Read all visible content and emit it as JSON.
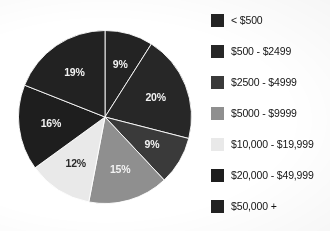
{
  "title_fragment": "",
  "chart_data": {
    "type": "pie",
    "title": "",
    "subtitle": "",
    "xlabel": "",
    "ylabel": "",
    "grid": false,
    "legend_position": "right",
    "start_angle_deg": 0,
    "direction": "clockwise",
    "value_unit": "percent",
    "categories": [
      "< $500",
      "$500 - $2499",
      "$2500 - $4999",
      "$5000 - $9999",
      "$10,000 - $19,999",
      "$20,000 - $49,999",
      "$50,000 +"
    ],
    "values": [
      9,
      20,
      9,
      15,
      12,
      16,
      19
    ],
    "data_labels": [
      "9%",
      "20%",
      "9%",
      "15%",
      "12%",
      "16%",
      "19%"
    ],
    "colors": [
      "#232323",
      "#272727",
      "#3a3a3a",
      "#8f8f8f",
      "#e9e9e9",
      "#1e1e1e",
      "#222222"
    ],
    "label_colors": [
      "light",
      "light",
      "light",
      "light",
      "dark",
      "light",
      "light"
    ],
    "slices": [
      {
        "label": "< $500",
        "value": 9,
        "display": "9%",
        "color": "#232323",
        "label_color": "light"
      },
      {
        "label": "$500 - $2499",
        "value": 20,
        "display": "20%",
        "color": "#272727",
        "label_color": "light"
      },
      {
        "label": "$2500 - $4999",
        "value": 9,
        "display": "9%",
        "color": "#3a3a3a",
        "label_color": "light"
      },
      {
        "label": "$5000 - $9999",
        "value": 15,
        "display": "15%",
        "color": "#8f8f8f",
        "label_color": "light"
      },
      {
        "label": "$10,000 - $19,999",
        "value": 12,
        "display": "12%",
        "color": "#e9e9e9",
        "label_color": "dark"
      },
      {
        "label": "$20,000 - $49,999",
        "value": 16,
        "display": "16%",
        "color": "#1e1e1e",
        "label_color": "light"
      },
      {
        "label": "$50,000 +",
        "value": 19,
        "display": "19%",
        "color": "#222222",
        "label_color": "light"
      }
    ]
  },
  "legend": {
    "items": [
      {
        "label": "< $500",
        "color": "#232323"
      },
      {
        "label": "$500 - $2499",
        "color": "#272727"
      },
      {
        "label": "$2500 - $4999",
        "color": "#3a3a3a"
      },
      {
        "label": "$5000 - $9999",
        "color": "#8f8f8f"
      },
      {
        "label": "$10,000 - $19,999",
        "color": "#e9e9e9"
      },
      {
        "label": "$20,000 - $49,999",
        "color": "#1e1e1e"
      },
      {
        "label": "$50,000 +",
        "color": "#222222"
      }
    ]
  }
}
